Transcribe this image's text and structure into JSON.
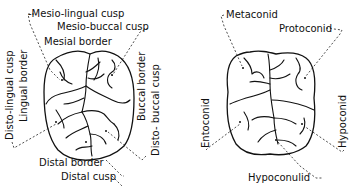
{
  "figure": {
    "left_tooth": {
      "name": "upper-molar-crown-borders-and-cusps",
      "labels": {
        "mesio_lingual_cusp": "-Mesio-lingual cusp",
        "mesio_buccal_cusp": "Mesio-buccal cusp",
        "mesial_border": "Mesial border",
        "disto_lingual_cusp": "Disto-lingual cusp",
        "lingual_border": "Lingual border",
        "buccal_border": "Buccal border",
        "disto_buccal_cusp": "Disto- buccal cusp",
        "distal_border": "Distal border",
        "distal_cusp": "Distal cusp"
      }
    },
    "right_tooth": {
      "name": "lower-molar-cusps",
      "labels": {
        "metaconid": "Metaconid",
        "protoconid": "Protoconid",
        "entoconid": "Entoconid",
        "hypoconid": "Hypoconid",
        "hypoconulid": "Hypoconulid"
      }
    }
  }
}
